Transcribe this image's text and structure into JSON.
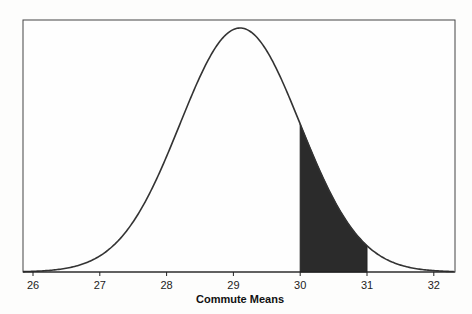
{
  "chart_data": {
    "type": "area",
    "title": "",
    "xlabel": "Commute Means",
    "ylabel": "",
    "distribution": "normal",
    "mean": 29.1,
    "sd": 0.9,
    "x_ticks": [
      26,
      27,
      28,
      29,
      30,
      31,
      32
    ],
    "xlim": [
      25.85,
      32.3
    ],
    "shaded_region": {
      "from": 30,
      "to": 31,
      "color": "#2b2b2b"
    },
    "curve_color": "#333333",
    "grid": false,
    "legend": null
  }
}
